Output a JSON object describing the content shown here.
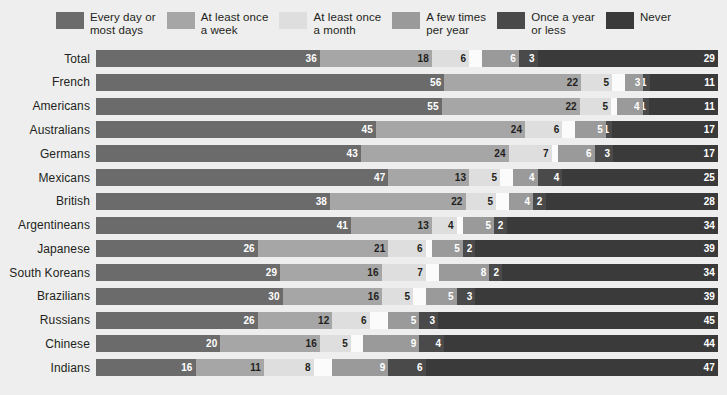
{
  "legend": {
    "items": [
      {
        "label": "Every day or\nmost days",
        "color": "#6b6b6b"
      },
      {
        "label": "At least once\na week",
        "color": "#a6a6a6"
      },
      {
        "label": "At least once\na month",
        "color": "#dedede"
      },
      {
        "label": "A few times\nper year",
        "color": "#9a9a9a"
      },
      {
        "label": "Once a year\nor less",
        "color": "#4a4a4a"
      },
      {
        "label": "Never",
        "color": "#3a3a3a"
      }
    ]
  },
  "chart_data": {
    "type": "bar",
    "subtype": "stacked-horizontal-100",
    "title": "",
    "xlabel": "",
    "ylabel": "",
    "xlim": [
      0,
      100
    ],
    "grid": false,
    "legend_position": "top",
    "categories": [
      "Total",
      "French",
      "Americans",
      "Australians",
      "Germans",
      "Mexicans",
      "British",
      "Argentineans",
      "Japanese",
      "South Koreans",
      "Brazilians",
      "Russians",
      "Chinese",
      "Indians"
    ],
    "series": [
      {
        "name": "Every day or most days",
        "color": "#6b6b6b",
        "values": [
          36,
          56,
          55,
          45,
          43,
          47,
          38,
          41,
          26,
          29,
          30,
          26,
          20,
          16
        ]
      },
      {
        "name": "At least once a week",
        "color": "#a6a6a6",
        "values": [
          18,
          22,
          22,
          24,
          24,
          13,
          22,
          13,
          21,
          16,
          16,
          12,
          16,
          11
        ]
      },
      {
        "name": "At least once a month",
        "color": "#dedede",
        "values": [
          6,
          5,
          5,
          6,
          7,
          5,
          5,
          4,
          6,
          7,
          5,
          6,
          5,
          8
        ]
      },
      {
        "name": "Don't know / refused",
        "color": "#fbfbfb",
        "values": [
          2,
          2,
          1,
          2,
          1,
          2,
          2,
          1,
          1,
          2,
          2,
          3,
          2,
          3
        ]
      },
      {
        "name": "A few times per year",
        "color": "#9a9a9a",
        "values": [
          6,
          3,
          4,
          5,
          6,
          4,
          4,
          5,
          5,
          8,
          5,
          5,
          9,
          9
        ]
      },
      {
        "name": "Once a year or less",
        "color": "#4a4a4a",
        "values": [
          3,
          1,
          1,
          1,
          3,
          4,
          2,
          2,
          2,
          2,
          3,
          3,
          4,
          6
        ]
      },
      {
        "name": "Never",
        "color": "#3a3a3a",
        "values": [
          29,
          11,
          11,
          17,
          17,
          25,
          28,
          34,
          39,
          34,
          39,
          45,
          44,
          47
        ]
      }
    ],
    "rows": [
      {
        "label": "Total",
        "segments": [
          {
            "series": "Every day or most days",
            "value": 36,
            "show_label": true
          },
          {
            "series": "At least once a week",
            "value": 18,
            "show_label": true
          },
          {
            "series": "At least once a month",
            "value": 6,
            "show_label": true
          },
          {
            "series": "Don't know / refused",
            "value": 2,
            "show_label": false
          },
          {
            "series": "A few times per year",
            "value": 6,
            "show_label": true
          },
          {
            "series": "Once a year or less",
            "value": 3,
            "show_label": true
          },
          {
            "series": "Never",
            "value": 29,
            "show_label": true
          }
        ]
      },
      {
        "label": "French",
        "segments": [
          {
            "series": "Every day or most days",
            "value": 56,
            "show_label": true
          },
          {
            "series": "At least once a week",
            "value": 22,
            "show_label": true
          },
          {
            "series": "At least once a month",
            "value": 5,
            "show_label": true
          },
          {
            "series": "Don't know / refused",
            "value": 2,
            "show_label": false
          },
          {
            "series": "A few times per year",
            "value": 3,
            "show_label": true
          },
          {
            "series": "Once a year or less",
            "value": 1,
            "show_label": true
          },
          {
            "series": "Never",
            "value": 11,
            "show_label": true
          }
        ]
      },
      {
        "label": "Americans",
        "segments": [
          {
            "series": "Every day or most days",
            "value": 55,
            "show_label": true
          },
          {
            "series": "At least once a week",
            "value": 22,
            "show_label": true
          },
          {
            "series": "At least once a month",
            "value": 5,
            "show_label": true
          },
          {
            "series": "Don't know / refused",
            "value": 1,
            "show_label": false
          },
          {
            "series": "A few times per year",
            "value": 4,
            "show_label": true
          },
          {
            "series": "Once a year or less",
            "value": 1,
            "show_label": true
          },
          {
            "series": "Never",
            "value": 11,
            "show_label": true
          }
        ]
      },
      {
        "label": "Australians",
        "segments": [
          {
            "series": "Every day or most days",
            "value": 45,
            "show_label": true
          },
          {
            "series": "At least once a week",
            "value": 24,
            "show_label": true
          },
          {
            "series": "At least once a month",
            "value": 6,
            "show_label": true
          },
          {
            "series": "Don't know / refused",
            "value": 2,
            "show_label": false
          },
          {
            "series": "A few times per year",
            "value": 5,
            "show_label": true
          },
          {
            "series": "Once a year or less",
            "value": 1,
            "show_label": true
          },
          {
            "series": "Never",
            "value": 17,
            "show_label": true
          }
        ]
      },
      {
        "label": "Germans",
        "segments": [
          {
            "series": "Every day or most days",
            "value": 43,
            "show_label": true
          },
          {
            "series": "At least once a week",
            "value": 24,
            "show_label": true
          },
          {
            "series": "At least once a month",
            "value": 7,
            "show_label": true
          },
          {
            "series": "Don't know / refused",
            "value": 1,
            "show_label": false
          },
          {
            "series": "A few times per year",
            "value": 6,
            "show_label": true
          },
          {
            "series": "Once a year or less",
            "value": 3,
            "show_label": true
          },
          {
            "series": "Never",
            "value": 17,
            "show_label": true
          }
        ]
      },
      {
        "label": "Mexicans",
        "segments": [
          {
            "series": "Every day or most days",
            "value": 47,
            "show_label": true
          },
          {
            "series": "At least once a week",
            "value": 13,
            "show_label": true
          },
          {
            "series": "At least once a month",
            "value": 5,
            "show_label": true
          },
          {
            "series": "Don't know / refused",
            "value": 2,
            "show_label": false
          },
          {
            "series": "A few times per year",
            "value": 4,
            "show_label": true
          },
          {
            "series": "Once a year or less",
            "value": 4,
            "show_label": true
          },
          {
            "series": "Never",
            "value": 25,
            "show_label": true
          }
        ]
      },
      {
        "label": "British",
        "segments": [
          {
            "series": "Every day or most days",
            "value": 38,
            "show_label": true
          },
          {
            "series": "At least once a week",
            "value": 22,
            "show_label": true
          },
          {
            "series": "At least once a month",
            "value": 5,
            "show_label": true
          },
          {
            "series": "Don't know / refused",
            "value": 2,
            "show_label": false
          },
          {
            "series": "A few times per year",
            "value": 4,
            "show_label": true
          },
          {
            "series": "Once a year or less",
            "value": 2,
            "show_label": true
          },
          {
            "series": "Never",
            "value": 28,
            "show_label": true
          }
        ]
      },
      {
        "label": "Argentineans",
        "segments": [
          {
            "series": "Every day or most days",
            "value": 41,
            "show_label": true
          },
          {
            "series": "At least once a week",
            "value": 13,
            "show_label": true
          },
          {
            "series": "At least once a month",
            "value": 4,
            "show_label": true
          },
          {
            "series": "Don't know / refused",
            "value": 1,
            "show_label": false
          },
          {
            "series": "A few times per year",
            "value": 5,
            "show_label": true
          },
          {
            "series": "Once a year or less",
            "value": 2,
            "show_label": true
          },
          {
            "series": "Never",
            "value": 34,
            "show_label": true
          }
        ]
      },
      {
        "label": "Japanese",
        "segments": [
          {
            "series": "Every day or most days",
            "value": 26,
            "show_label": true
          },
          {
            "series": "At least once a week",
            "value": 21,
            "show_label": true
          },
          {
            "series": "At least once a month",
            "value": 6,
            "show_label": true
          },
          {
            "series": "Don't know / refused",
            "value": 1,
            "show_label": false
          },
          {
            "series": "A few times per year",
            "value": 5,
            "show_label": true
          },
          {
            "series": "Once a year or less",
            "value": 2,
            "show_label": true
          },
          {
            "series": "Never",
            "value": 39,
            "show_label": true
          }
        ]
      },
      {
        "label": "South Koreans",
        "segments": [
          {
            "series": "Every day or most days",
            "value": 29,
            "show_label": true
          },
          {
            "series": "At least once a week",
            "value": 16,
            "show_label": true
          },
          {
            "series": "At least once a month",
            "value": 7,
            "show_label": true
          },
          {
            "series": "Don't know / refused",
            "value": 2,
            "show_label": false
          },
          {
            "series": "A few times per year",
            "value": 8,
            "show_label": true
          },
          {
            "series": "Once a year or less",
            "value": 2,
            "show_label": true
          },
          {
            "series": "Never",
            "value": 34,
            "show_label": true
          }
        ]
      },
      {
        "label": "Brazilians",
        "segments": [
          {
            "series": "Every day or most days",
            "value": 30,
            "show_label": true
          },
          {
            "series": "At least once a week",
            "value": 16,
            "show_label": true
          },
          {
            "series": "At least once a month",
            "value": 5,
            "show_label": true
          },
          {
            "series": "Don't know / refused",
            "value": 2,
            "show_label": false
          },
          {
            "series": "A few times per year",
            "value": 5,
            "show_label": true
          },
          {
            "series": "Once a year or less",
            "value": 3,
            "show_label": true
          },
          {
            "series": "Never",
            "value": 39,
            "show_label": true
          }
        ]
      },
      {
        "label": "Russians",
        "segments": [
          {
            "series": "Every day or most days",
            "value": 26,
            "show_label": true
          },
          {
            "series": "At least once a week",
            "value": 12,
            "show_label": true
          },
          {
            "series": "At least once a month",
            "value": 6,
            "show_label": true
          },
          {
            "series": "Don't know / refused",
            "value": 3,
            "show_label": false
          },
          {
            "series": "A few times per year",
            "value": 5,
            "show_label": true
          },
          {
            "series": "Once a year or less",
            "value": 3,
            "show_label": true
          },
          {
            "series": "Never",
            "value": 45,
            "show_label": true
          }
        ]
      },
      {
        "label": "Chinese",
        "segments": [
          {
            "series": "Every day or most days",
            "value": 20,
            "show_label": true
          },
          {
            "series": "At least once a week",
            "value": 16,
            "show_label": true
          },
          {
            "series": "At least once a month",
            "value": 5,
            "show_label": true
          },
          {
            "series": "Don't know / refused",
            "value": 2,
            "show_label": false
          },
          {
            "series": "A few times per year",
            "value": 9,
            "show_label": true
          },
          {
            "series": "Once a year or less",
            "value": 4,
            "show_label": true
          },
          {
            "series": "Never",
            "value": 44,
            "show_label": true
          }
        ]
      },
      {
        "label": "Indians",
        "segments": [
          {
            "series": "Every day or most days",
            "value": 16,
            "show_label": true
          },
          {
            "series": "At least once a week",
            "value": 11,
            "show_label": true
          },
          {
            "series": "At least once a month",
            "value": 8,
            "show_label": true
          },
          {
            "series": "Don't know / refused",
            "value": 3,
            "show_label": false
          },
          {
            "series": "A few times per year",
            "value": 9,
            "show_label": true
          },
          {
            "series": "Once a year or less",
            "value": 6,
            "show_label": true
          },
          {
            "series": "Never",
            "value": 47,
            "show_label": true
          }
        ]
      }
    ]
  }
}
